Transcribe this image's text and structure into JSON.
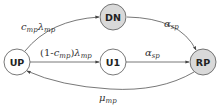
{
  "diagram": {
    "type": "state-transition",
    "nodes": [
      {
        "id": "DN",
        "label": "DN",
        "cx": 113,
        "cy": 17,
        "r": 13,
        "fill": "#d9d9d9"
      },
      {
        "id": "UP",
        "label": "UP",
        "cx": 17,
        "cy": 62,
        "r": 13,
        "fill": "#ffffff"
      },
      {
        "id": "U1",
        "label": "U1",
        "cx": 113,
        "cy": 62,
        "r": 13,
        "fill": "#ffffff"
      },
      {
        "id": "RP",
        "label": "RP",
        "cx": 203,
        "cy": 62,
        "r": 13,
        "fill": "#d9d9d9"
      }
    ],
    "edges": [
      {
        "from": "UP",
        "to": "DN",
        "label_main": "c",
        "label_sub": "mp",
        "label_main2": "λ",
        "label_sub2": "mp"
      },
      {
        "from": "UP",
        "to": "U1",
        "label_prefix": "(1-",
        "label_main": "c",
        "label_sub": "mp",
        "label_mid": ")",
        "label_main2": "λ",
        "label_sub2": "mp"
      },
      {
        "from": "DN",
        "to": "RP",
        "label_main": "α",
        "label_sub": "sp"
      },
      {
        "from": "U1",
        "to": "RP",
        "label_main": "α",
        "label_sub": "sp"
      },
      {
        "from": "RP",
        "to": "UP",
        "label_main": "μ",
        "label_sub": "mp"
      }
    ],
    "colors": {
      "stroke": "#555555",
      "gray_fill": "#d9d9d9",
      "white_fill": "#ffffff"
    }
  }
}
